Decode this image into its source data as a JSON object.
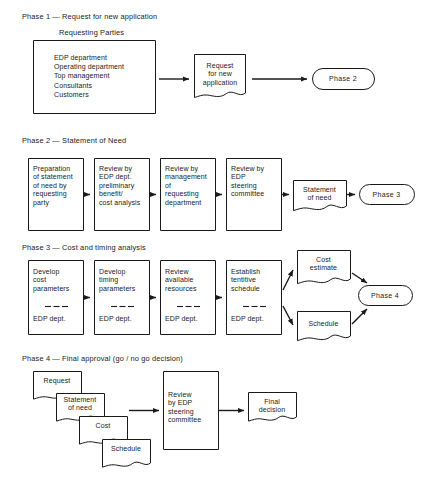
{
  "document": {
    "title": "Four-phase EDP application approval flowchart",
    "background_color": "#ffffff",
    "ink_color": "#1a1a1a"
  },
  "phases": [
    {
      "id": "phase-1",
      "heading": "Phase 1 — Request for new application",
      "caption": "Requesting Parties",
      "requesting_parties": [
        "EDP department",
        "Operating department",
        "Top management",
        "Consultants",
        "Customers"
      ],
      "requesting_parties_text": "EDP department\nOperating department\nTop management\nConsultants\nCustomers",
      "document_label": "Request\nfor new\napplication",
      "terminator_label": "Phase 2"
    },
    {
      "id": "phase-2",
      "heading": "Phase 2 — Statement of Need",
      "steps": [
        "Preparation\nof statement\nof need by\nrequesting\nparty",
        "Review by\nEDP dept.\npreliminary\nbenefit/\ncost analysis",
        "Review by\nmanagement\nof\nrequesting\ndepartment",
        "Review by\nEDP\nsteering\ncommittee"
      ],
      "document_label": "Statement\nof need",
      "terminator_label": "Phase 3"
    },
    {
      "id": "phase-3",
      "heading": "Phase 3 — Cost and timing analysis",
      "steps": [
        {
          "action": "Develop\ncost\nparameters",
          "owner": "EDP dept."
        },
        {
          "action": "Develop\ntiming\nparameters",
          "owner": "EDP dept."
        },
        {
          "action": "Review\navailable\nresources",
          "owner": "EDP dept."
        },
        {
          "action": "Establish\ntentitive\nschedule",
          "owner": "EDP dept."
        }
      ],
      "outputs": [
        "Cost\nestimate",
        "Schedule"
      ],
      "terminator_label": "Phase 4"
    },
    {
      "id": "phase-4",
      "heading": "Phase 4 — Final approval (go / no go decision)",
      "input_documents": [
        "Request",
        "Statement\nof need",
        "Cost",
        "Schedule"
      ],
      "process_label": "Review\nby EDP\nsteering\ncommittee",
      "output_label": "Final\ndecision"
    }
  ]
}
